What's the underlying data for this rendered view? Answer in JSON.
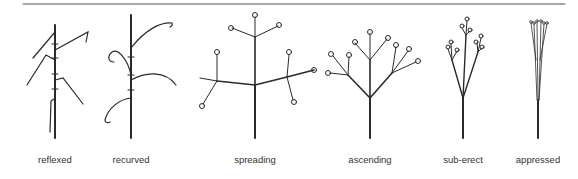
{
  "figure": {
    "panels": [
      {
        "id": "reflexed",
        "label": "reflexed",
        "x": 55
      },
      {
        "id": "recurved",
        "label": "recurved",
        "x": 131
      },
      {
        "id": "spreading",
        "label": "spreading",
        "x": 255
      },
      {
        "id": "ascending",
        "label": "ascending",
        "x": 370
      },
      {
        "id": "sub-erect",
        "label": "sub-erect",
        "x": 463
      },
      {
        "id": "appressed",
        "label": "appressed",
        "x": 538
      }
    ]
  },
  "colors": {
    "stroke": "#2a2a2a",
    "rule": "#555555",
    "text": "#333333"
  }
}
